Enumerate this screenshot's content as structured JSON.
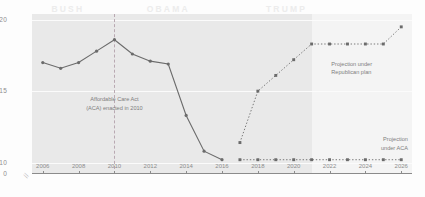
{
  "chart_data": {
    "type": "line",
    "title": "",
    "xlabel": "",
    "ylabel": "",
    "xlim": [
      2005.4,
      2026.6
    ],
    "ylim": [
      9.2,
      20.4
    ],
    "y_axis_broken": true,
    "y_break_label": "//",
    "grid": true,
    "legend": "annotations",
    "yticks": [
      "20",
      "15",
      "10",
      "0"
    ],
    "ytick_values": [
      20,
      15,
      10,
      0
    ],
    "xticks": [
      "2006",
      "2008",
      "2010",
      "2012",
      "2014",
      "2016",
      "2018",
      "2020",
      "2022",
      "2024",
      "2026"
    ],
    "xtick_values": [
      2006,
      2008,
      2010,
      2012,
      2014,
      2016,
      2018,
      2020,
      2022,
      2024,
      2026
    ],
    "series": [
      {
        "name": "Historical uninsured rate",
        "style": "solid",
        "color": "#6b6b6b",
        "x": [
          2006,
          2007,
          2008,
          2009,
          2010,
          2011,
          2012,
          2013,
          2014,
          2015,
          2016
        ],
        "values": [
          17.0,
          16.6,
          17.0,
          17.8,
          18.6,
          17.6,
          17.1,
          16.9,
          13.3,
          10.8,
          10.2
        ]
      },
      {
        "name": "Projection under Republican plan",
        "style": "dashed",
        "color": "#6b6b6b",
        "x": [
          2017,
          2018,
          2019,
          2020,
          2021,
          2022,
          2023,
          2024,
          2025,
          2026
        ],
        "values": [
          11.4,
          15.0,
          16.1,
          17.2,
          18.3,
          18.3,
          18.3,
          18.3,
          18.3,
          19.5
        ]
      },
      {
        "name": "Projection under ACA",
        "style": "dashed",
        "color": "#6b6b6b",
        "x": [
          2017,
          2018,
          2019,
          2020,
          2021,
          2022,
          2023,
          2024,
          2025,
          2026
        ],
        "values": [
          10.2,
          10.2,
          10.2,
          10.2,
          10.2,
          10.2,
          10.2,
          10.2,
          10.2,
          10.2
        ]
      }
    ],
    "eras": [
      {
        "label": "BUSH",
        "center": 2007.4
      },
      {
        "label": "OBAMA",
        "center": 2013.0
      },
      {
        "label": "TRUMP",
        "center": 2019.6
      }
    ],
    "annotations": [
      {
        "name": "aca-enacted",
        "text_line1": "Affordable Care Act",
        "text_line2": "(ACA) enacted in 2010",
        "at_x": 2010
      },
      {
        "name": "republican-projection",
        "text_line1": "Projection under",
        "text_line2": "Republican plan"
      },
      {
        "name": "aca-projection",
        "text_line1": "Projection",
        "text_line2": "under ACA"
      }
    ],
    "marker_line_2010": {
      "year": 2010,
      "style": "dashed",
      "color": "#b9a9b2"
    },
    "shading": {
      "gray_until_year": 2021,
      "gray_color": "#e9e9e9",
      "light_color": "#f4f4f4"
    }
  }
}
